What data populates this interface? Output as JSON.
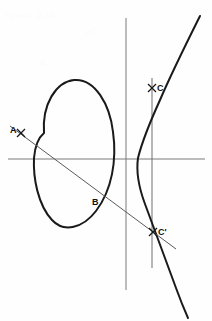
{
  "figure": {
    "background_color": "#fefefe",
    "curve_color": "#1a1a1a",
    "axis_color": "#7b7b7b",
    "secant_color": "#5a5a5a",
    "label_color": "#111111",
    "width": 212,
    "height": 321
  },
  "labels": {
    "a": "A",
    "b": "B",
    "c": "C",
    "c_prime": "C'"
  },
  "ghost_text": {
    "line1": "space   2   to",
    "line2": "of",
    "line3": "a"
  },
  "chart_data": {
    "type": "scatter",
    "xlabel": "",
    "ylabel": "",
    "grid": false,
    "legend": null,
    "axes": {
      "x_axis_pixel_y": 159,
      "x_axis_pixel_x_start": 8,
      "x_axis_pixel_x_end": 205,
      "y_axis_pixel_x": 126,
      "y_axis_pixel_y_start": 18,
      "y_axis_pixel_y_end": 290
    },
    "points": [
      {
        "label": "A",
        "px": 21,
        "py": 133
      },
      {
        "label": "B",
        "px": 97,
        "py": 190
      },
      {
        "label": "C",
        "px": 152,
        "py": 88
      },
      {
        "label": "C'",
        "px": 153,
        "py": 232
      }
    ],
    "series": [
      {
        "name": "oval-component",
        "kind": "closed-curve",
        "path": "M 44,133 C 42,104 56,82 74,80 C 95,78 110,105 113,132 C 117,160 112,190 96,211 C 83,228 64,233 52,220 C 38,205 33,178 34,158 C 35,146 38,138 44,133 Z"
      },
      {
        "name": "unbounded-branch",
        "kind": "open-curve",
        "path": "M 200,16 C 186,44 172,72 160,100 C 150,122 142,142 138,158 C 136,172 139,188 145,204 C 153,226 165,258 176,288 C 180,299 184,309 188,318"
      }
    ],
    "lines": [
      {
        "name": "secant-line-A-B-Cprime",
        "from_px": [
          10,
          126
        ],
        "to_px": [
          176,
          249
        ],
        "through": [
          "A",
          "B",
          "C'"
        ]
      },
      {
        "name": "vertical-line-C-Cprime",
        "from_px": [
          152,
          78
        ],
        "to_px": [
          152,
          268
        ]
      }
    ]
  }
}
